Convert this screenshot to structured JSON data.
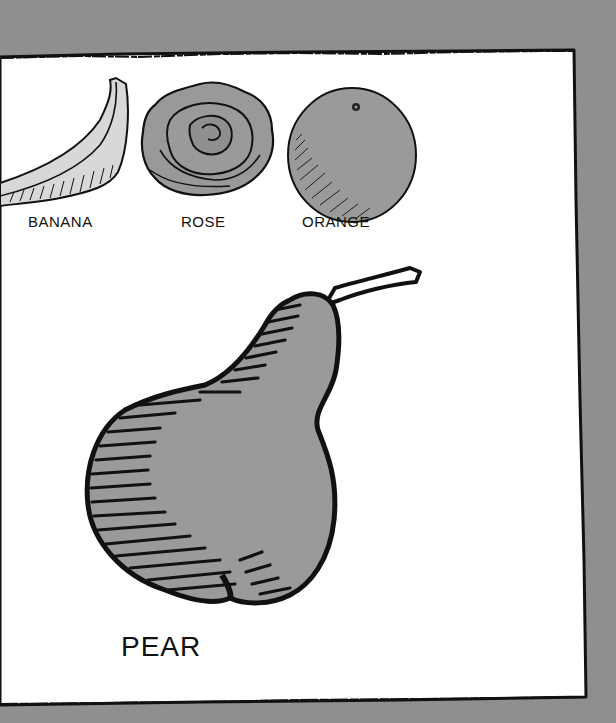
{
  "illustration": {
    "description": "Hand-drawn pen-and-ink illustration of fruits and a flower on white paper with a rough black border, against a gray background",
    "colors": {
      "background": "#8f8f8f",
      "paper": "#ffffff",
      "ink": "#111111",
      "fill_gray": "#9a9a9a",
      "banana_fill": "#d8d8d8"
    },
    "items": [
      {
        "id": "banana",
        "label": "BANANA",
        "icon": "banana-icon"
      },
      {
        "id": "rose",
        "label": "ROSE",
        "icon": "rose-icon"
      },
      {
        "id": "orange",
        "label": "ORANGE",
        "icon": "orange-icon"
      },
      {
        "id": "pear",
        "label": "PEAR",
        "icon": "pear-icon"
      }
    ]
  }
}
